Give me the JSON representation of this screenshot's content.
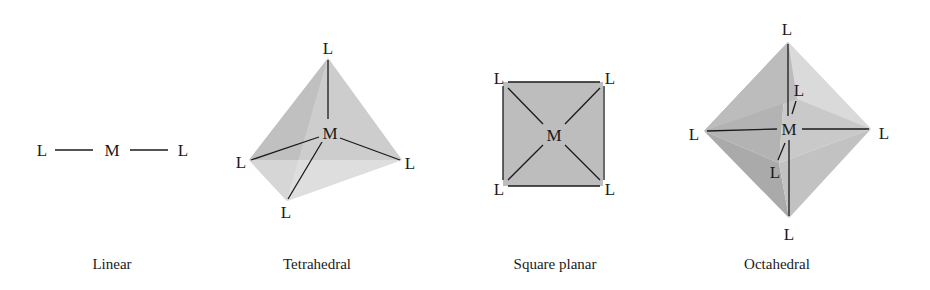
{
  "figure": {
    "atoms": {
      "metal": "M",
      "ligand": "L"
    },
    "colors": {
      "ink": "#1a1a1a",
      "face_light": "#dcdcdc",
      "face_mid": "#c4c4c4",
      "face_dark": "#a9a9a9",
      "square_fill": "#bdbdbd"
    },
    "geometries": [
      {
        "name": "Linear",
        "caption": "Linear",
        "coordination_number": 2,
        "center_label": "M",
        "ligand_labels": [
          "L",
          "L"
        ]
      },
      {
        "name": "Tetrahedral",
        "caption": "Tetrahedral",
        "coordination_number": 4,
        "center_label": "M",
        "ligand_labels": [
          "L",
          "L",
          "L",
          "L"
        ]
      },
      {
        "name": "Square planar",
        "caption": "Square planar",
        "coordination_number": 4,
        "center_label": "M",
        "ligand_labels": [
          "L",
          "L",
          "L",
          "L"
        ]
      },
      {
        "name": "Octahedral",
        "caption": "Octahedral",
        "coordination_number": 6,
        "center_label": "M",
        "ligand_labels": [
          "L",
          "L",
          "L",
          "L",
          "L",
          "L"
        ]
      }
    ]
  }
}
